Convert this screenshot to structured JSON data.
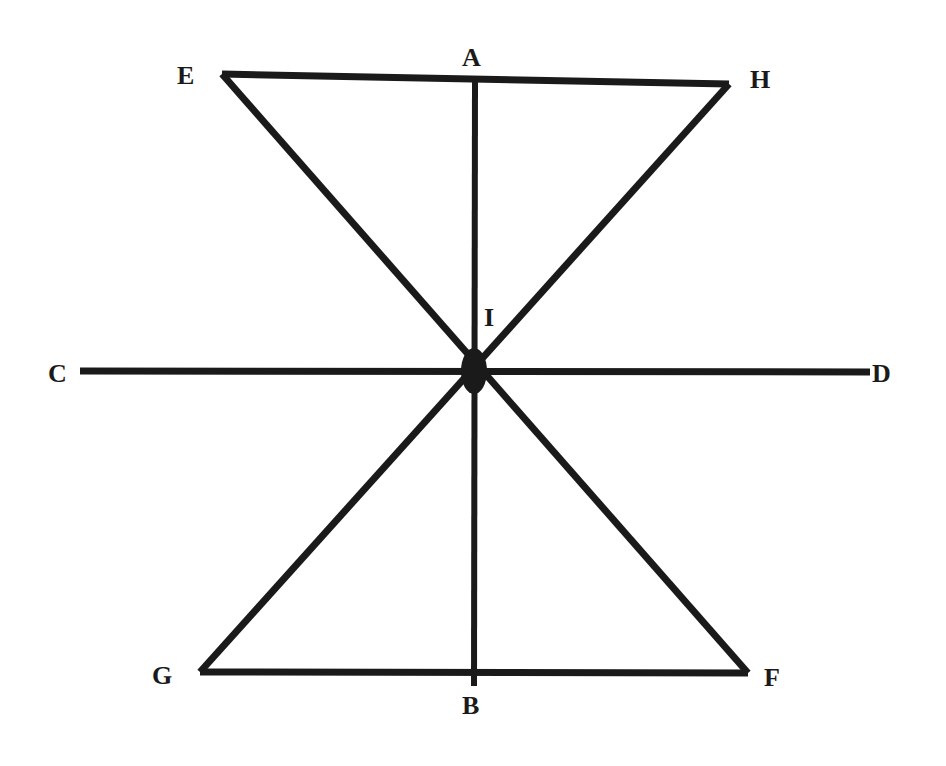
{
  "diagram": {
    "type": "geometric-figure",
    "stroke_color": "#1a1a1a",
    "background": "#ffffff",
    "points": {
      "A": {
        "label": "A",
        "x": 475,
        "y": 80
      },
      "B": {
        "label": "B",
        "x": 474,
        "y": 683
      },
      "C": {
        "label": "C",
        "x": 80,
        "y": 371
      },
      "D": {
        "label": "D",
        "x": 870,
        "y": 371
      },
      "E": {
        "label": "E",
        "x": 222,
        "y": 74
      },
      "F": {
        "label": "F",
        "x": 748,
        "y": 673
      },
      "G": {
        "label": "G",
        "x": 200,
        "y": 672
      },
      "H": {
        "label": "H",
        "x": 729,
        "y": 84
      },
      "I": {
        "label": "I",
        "x": 474,
        "y": 371
      }
    },
    "segments": [
      "EH",
      "AB",
      "CD",
      "EF",
      "HG",
      "GF"
    ],
    "center_point": "I"
  }
}
